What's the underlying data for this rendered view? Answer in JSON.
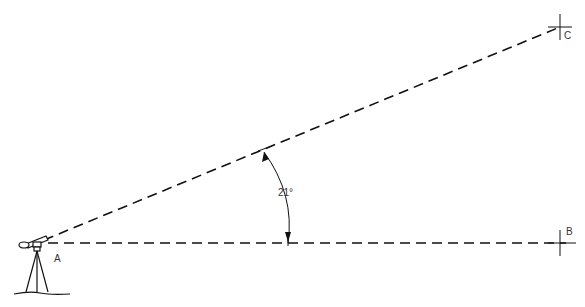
{
  "diagram": {
    "title": "",
    "points": {
      "A": {
        "label": "A"
      },
      "B": {
        "label": "B"
      },
      "C": {
        "label": "C"
      }
    },
    "angle": {
      "value": "21°"
    },
    "instrument": "surveying-instrument-on-tripod",
    "line_color": "#111111"
  }
}
